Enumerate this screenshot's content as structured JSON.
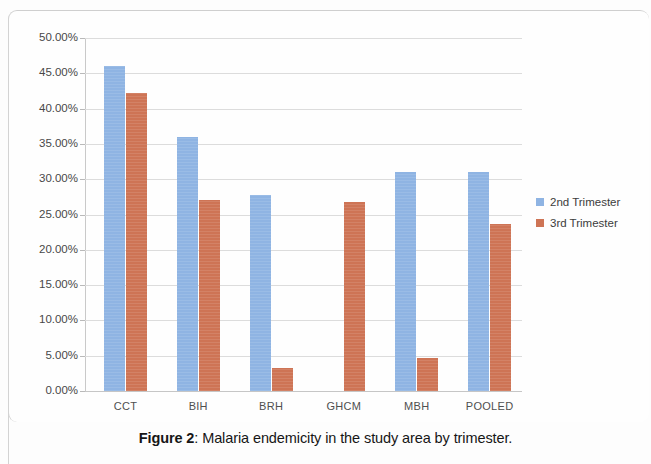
{
  "figure": {
    "caption_label": "Figure 2",
    "caption_separator": ": ",
    "caption_text": "Malaria endemicity in the study area by trimester."
  },
  "legend": {
    "position": "right",
    "entries": [
      {
        "label": "2nd Trimester",
        "color": "#8FB4E3"
      },
      {
        "label": "3rd Trimester",
        "color": "#CE7455"
      }
    ]
  },
  "axis": {
    "y_tick_labels": [
      "50.00%",
      "45.00%",
      "40.00%",
      "35.00%",
      "30.00%",
      "25.00%",
      "20.00%",
      "15.00%",
      "10.00%",
      "5.00%",
      "0.00%"
    ],
    "x_tick_labels": [
      "CCT",
      "BIH",
      "BRH",
      "GHCM",
      "MBH",
      "POOLED"
    ]
  },
  "chart_data": {
    "type": "bar",
    "title": "",
    "subtitle": "",
    "xlabel": "",
    "ylabel": "",
    "categories": [
      "CCT",
      "BIH",
      "BRH",
      "GHCM",
      "MBH",
      "POOLED"
    ],
    "series": [
      {
        "name": "2nd Trimester",
        "color": "#8FB4E3",
        "values": [
          46.0,
          36.0,
          27.8,
          null,
          31.0,
          31.0
        ]
      },
      {
        "name": "3rd Trimester",
        "color": "#CE7455",
        "values": [
          42.2,
          27.0,
          3.3,
          26.8,
          4.7,
          23.7
        ]
      }
    ],
    "ylim": [
      0,
      50
    ],
    "y_tick_values": [
      0,
      5,
      10,
      15,
      20,
      25,
      30,
      35,
      40,
      45,
      50
    ],
    "y_tick_format": "percent_2dp",
    "grid": true,
    "grid_axis": "y",
    "legend_position": "right"
  }
}
